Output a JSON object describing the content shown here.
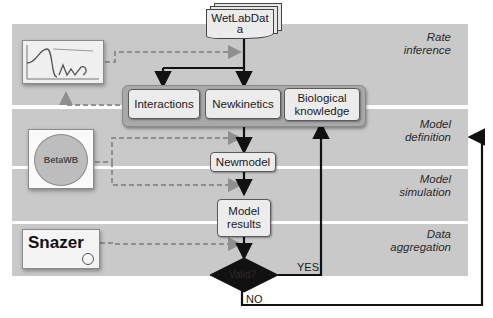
{
  "diagram": {
    "input": {
      "label_line1": "WetLabDat",
      "label_line2": "a"
    },
    "stages": [
      {
        "id": "rate-inference",
        "label_line1": "Rate",
        "label_line2": "inference"
      },
      {
        "id": "model-definition",
        "label_line1": "Model",
        "label_line2": "definition"
      },
      {
        "id": "model-simulation",
        "label_line1": "Model",
        "label_line2": "simulation"
      },
      {
        "id": "data-aggregation",
        "label_line1": "Data",
        "label_line2": "aggregation"
      }
    ],
    "group_boxes": [
      {
        "label": "Interactions"
      },
      {
        "label": "Newkinetics"
      },
      {
        "label_line1": "Biological",
        "label_line2": "knowledge"
      }
    ],
    "newmodel": {
      "label": "Newmodel"
    },
    "model_results": {
      "label_line1": "Model",
      "label_line2": "results"
    },
    "decision": {
      "label": "Valid?",
      "yes_label": "YES",
      "no_label": "NO"
    },
    "tools": [
      {
        "name": "rate-plot-tool",
        "label": ""
      },
      {
        "name": "betawb-tool",
        "label": "BetaWB"
      },
      {
        "name": "snazer-tool",
        "label": "Snazer"
      }
    ],
    "colors": {
      "band": "#c9c9c9",
      "box": "#ececec",
      "group": "#a9a9a9",
      "arrow": "#111111",
      "dashed": "#8f8f8f"
    }
  }
}
